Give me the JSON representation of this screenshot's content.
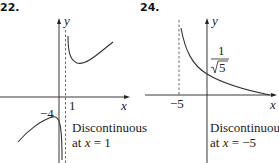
{
  "figures": [
    {
      "number": "22.",
      "axis_x": "x",
      "axis_y": "y",
      "tick_x": "1",
      "tick_y": "−4",
      "note_line1": "Discontinuous",
      "note_line2": "at x = 1",
      "note_prefix": "at ",
      "note_var": "x",
      "note_suffix": " = 1"
    },
    {
      "number": "24.",
      "axis_x": "x",
      "axis_y": "y",
      "tick_x": "−5",
      "label_num": "1",
      "label_den": "5",
      "note_line1": "Discontinuous",
      "note_line2": "at x = −5",
      "note_prefix": "at ",
      "note_var": "x",
      "note_suffix": " = −5"
    }
  ]
}
